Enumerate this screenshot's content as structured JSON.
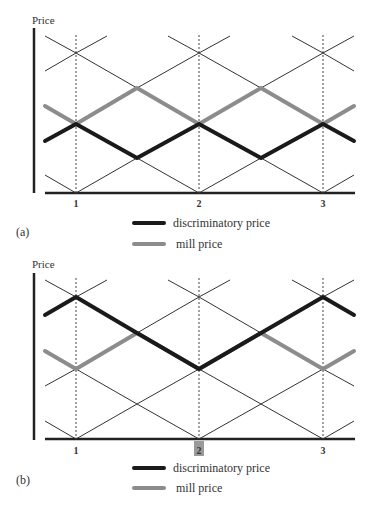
{
  "figure": {
    "panels": [
      {
        "id": "a",
        "panel_label": "(a)",
        "y_axis_label": "Price",
        "x_ticks": [
          "1",
          "2",
          "3"
        ],
        "highlighted_tick": null,
        "legend": [
          {
            "label": "discriminatory price",
            "color": "#1a1a1a"
          },
          {
            "label": "mill price",
            "color": "#8c8c8c"
          }
        ]
      },
      {
        "id": "b",
        "panel_label": "(b)",
        "y_axis_label": "Price",
        "x_ticks": [
          "1",
          "2",
          "3"
        ],
        "highlighted_tick": "2",
        "legend": [
          {
            "label": "discriminatory price",
            "color": "#1a1a1a"
          },
          {
            "label": "mill price",
            "color": "#8c8c8c"
          }
        ]
      }
    ]
  },
  "colors": {
    "discriminatory": "#1a1a1a",
    "mill": "#8c8c8c",
    "highlight_box": "#9a9a9a"
  }
}
